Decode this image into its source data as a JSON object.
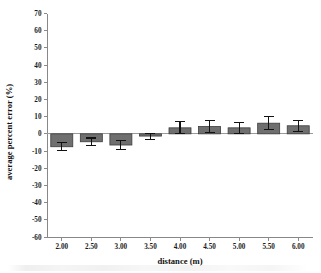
{
  "chart_data": {
    "type": "bar",
    "title": "",
    "xlabel": "distance (m)",
    "ylabel": "average percent error (%)",
    "categories": [
      "2.00",
      "2.50",
      "3.00",
      "3.50",
      "4.00",
      "4.50",
      "5.00",
      "5.50",
      "6.00"
    ],
    "values": [
      -7.5,
      -4.6,
      -6.5,
      -1.3,
      3.5,
      4.3,
      3.5,
      6.2,
      4.7
    ],
    "errors": [
      2.4,
      2.2,
      2.6,
      2.2,
      3.5,
      3.3,
      3.1,
      3.7,
      3.3
    ],
    "ylim": [
      -60,
      70
    ],
    "ytick_labels": [
      "70",
      "60",
      "50",
      "40",
      "30",
      "20",
      "10",
      "0",
      "-10",
      "-20",
      "-30",
      "-40",
      "-50",
      "-60"
    ],
    "ytick_values": [
      70,
      60,
      50,
      40,
      30,
      20,
      10,
      0,
      -10,
      -20,
      -30,
      -40,
      -50,
      -60
    ],
    "grid": false,
    "legend": "none",
    "bar_color": "#6f6f6f",
    "bar_border_color": "#3d3d3d",
    "error_bar_color": "#111111",
    "axis_color": "#888888"
  }
}
